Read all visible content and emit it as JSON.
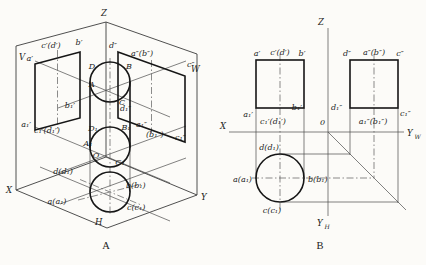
{
  "colors": {
    "ink": "#1b1b1b",
    "paper": "#fcfbf8"
  },
  "figure_a": {
    "caption": "A",
    "axes": {
      "z": "Z",
      "x": "X",
      "y": "Y"
    },
    "planes": {
      "frontal": "V",
      "profile": "W",
      "horizontal": "H"
    },
    "front_view": {
      "top_left": "a′",
      "top_mid": "c′(d′)",
      "top_right": "b′",
      "bottom_left": "a₁′",
      "bottom_mid": "c₁′(d₁′)",
      "bottom_right": "b₁′"
    },
    "profile_view": {
      "top_left": "d″",
      "top_mid": "a″(b″)",
      "top_right": "c″",
      "bottom_left": "d₁″",
      "bottom_mid_a": "a₁″",
      "bottom_mid_b": "(b₁″)",
      "bottom_right": "c₁″"
    },
    "top_circle": {
      "top_left": "D",
      "top_right": "B",
      "left": "A",
      "bottom_right": "C"
    },
    "bottom_circle": {
      "top_left": "D₁",
      "top_right": "B₁",
      "left": "A₁",
      "bottom_right": "C₁",
      "origin": "O"
    },
    "horizontal_view": {
      "front": "d(d₁)",
      "left": "a(a₁)",
      "right": "b(b₁)",
      "back": "c(c₁)"
    }
  },
  "figure_b": {
    "caption": "B",
    "axes": {
      "z": "Z",
      "x": "X",
      "origin": "0",
      "yw": {
        "main": "Y",
        "sub": "W"
      },
      "yh": {
        "main": "Y",
        "sub": "H"
      }
    },
    "front_view": {
      "top_left": "a′",
      "top_mid": "c′(d′)",
      "top_right": "b′",
      "bottom_left": "a₁′",
      "bottom_mid": "c₁′(d₁′)",
      "bottom_right": "b₁′"
    },
    "profile_view": {
      "top_left": "d″",
      "top_mid": "a″(b″)",
      "top_right": "c″",
      "bottom_left": "d₁″",
      "bottom_mid": "a₁″(b₁″)",
      "bottom_right": "c₁″"
    },
    "top_view": {
      "front": "d(d₁)",
      "left": "a(a₁)",
      "right": "b(b₁)",
      "back": "c(c₁)"
    }
  }
}
